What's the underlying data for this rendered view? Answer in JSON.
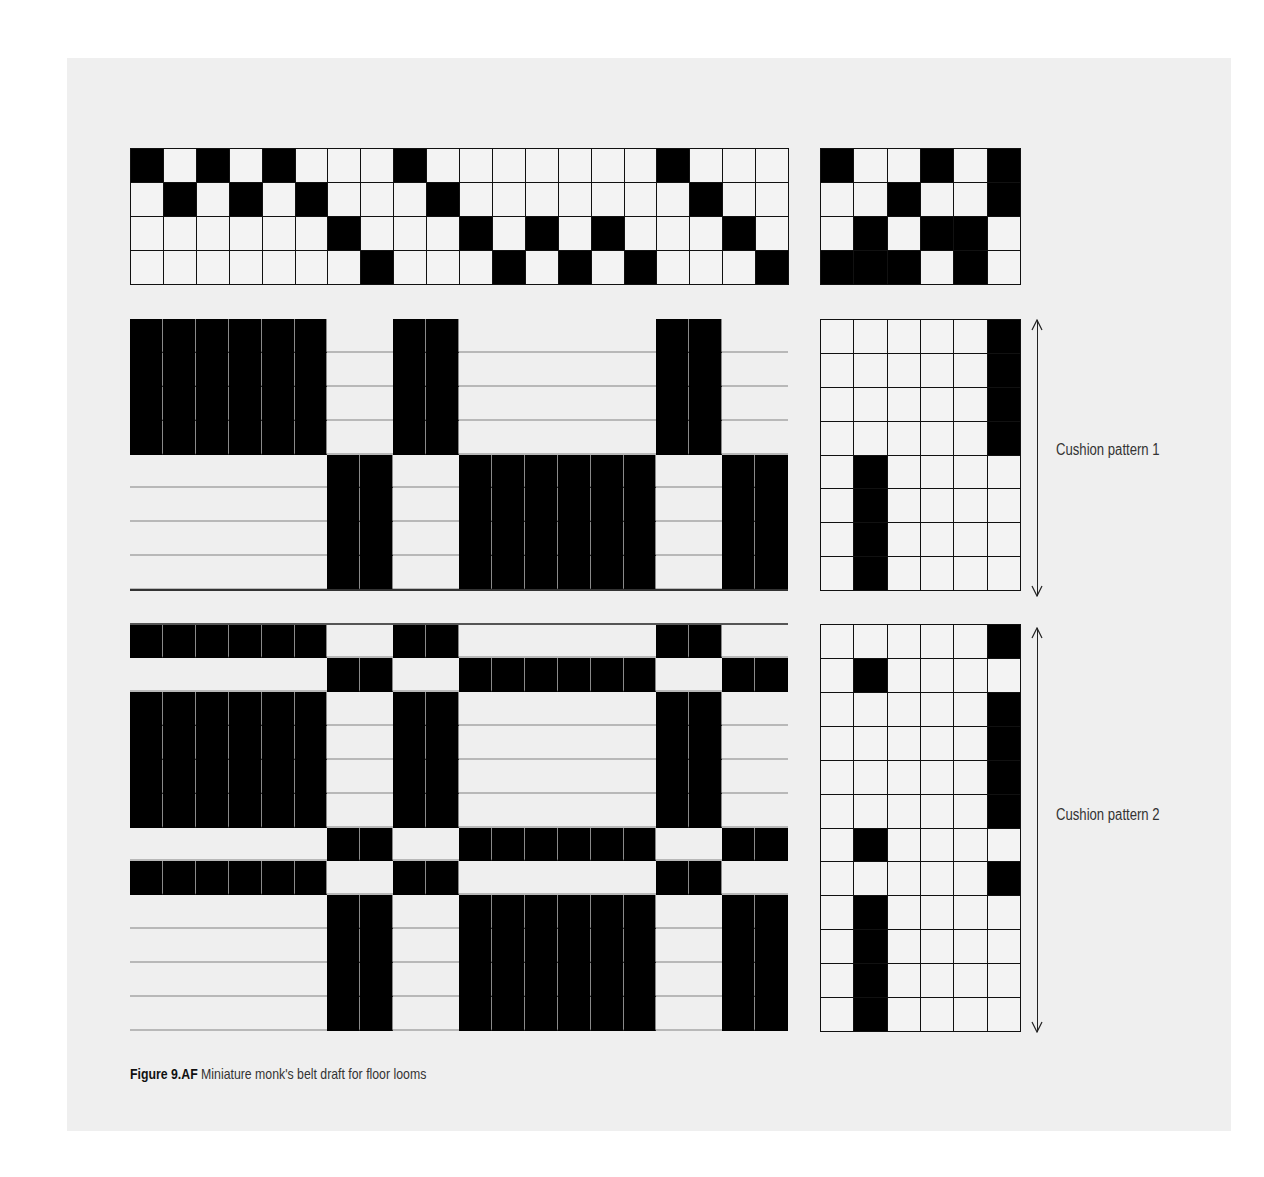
{
  "figure": {
    "caption_label": "Figure 9.AF",
    "caption_text": " Miniature monk's belt draft for floor looms"
  },
  "labels": {
    "pattern1": "Cushion pattern 1",
    "pattern2": "Cushion pattern 2"
  },
  "colors": {
    "panel_bg": "#efefef",
    "filled": "#000000",
    "grid_line": "#111111",
    "weft_line": "#b8b8b8"
  },
  "draft": {
    "warp_ends": 20,
    "shafts": 4,
    "treadles": 6,
    "threading": [
      [
        1,
        0,
        1,
        0,
        1,
        0,
        0,
        0,
        1,
        0,
        0,
        0,
        0,
        0,
        0,
        0,
        1,
        0,
        0,
        0
      ],
      [
        0,
        1,
        0,
        1,
        0,
        1,
        0,
        0,
        0,
        1,
        0,
        0,
        0,
        0,
        0,
        0,
        0,
        1,
        0,
        0
      ],
      [
        0,
        0,
        0,
        0,
        0,
        0,
        1,
        0,
        0,
        0,
        1,
        0,
        1,
        0,
        1,
        0,
        0,
        0,
        1,
        0
      ],
      [
        0,
        0,
        0,
        0,
        0,
        0,
        0,
        1,
        0,
        0,
        0,
        1,
        0,
        1,
        0,
        1,
        0,
        0,
        0,
        1
      ]
    ],
    "tieup": [
      [
        1,
        0,
        0,
        1,
        0,
        1
      ],
      [
        0,
        0,
        1,
        0,
        0,
        1
      ],
      [
        0,
        1,
        0,
        1,
        1,
        0
      ],
      [
        1,
        1,
        1,
        0,
        1,
        0
      ]
    ],
    "block_A": [
      1,
      1,
      1,
      1,
      1,
      1,
      0,
      0,
      1,
      1,
      0,
      0,
      0,
      0,
      0,
      0,
      1,
      1,
      0,
      0
    ],
    "block_B": [
      0,
      0,
      0,
      0,
      0,
      0,
      1,
      1,
      0,
      0,
      1,
      1,
      1,
      1,
      1,
      1,
      0,
      0,
      1,
      1
    ],
    "pattern1": {
      "label": "Cushion pattern 1",
      "rows": [
        "A",
        "A",
        "A",
        "A",
        "B",
        "B",
        "B",
        "B"
      ],
      "treadling": [
        6,
        6,
        6,
        6,
        2,
        2,
        2,
        2
      ]
    },
    "pattern2": {
      "label": "Cushion pattern 2",
      "rows": [
        "A",
        "B",
        "A",
        "A",
        "A",
        "A",
        "B",
        "A",
        "B",
        "B",
        "B",
        "B"
      ],
      "treadling": [
        6,
        2,
        6,
        6,
        6,
        6,
        2,
        6,
        2,
        2,
        2,
        2
      ]
    }
  }
}
